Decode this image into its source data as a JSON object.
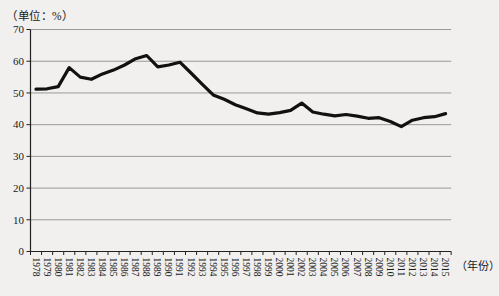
{
  "header": {
    "unit_label": "（单位：%）"
  },
  "axis_captions": {
    "x_caption": "（年份）"
  },
  "chart_data": {
    "type": "line",
    "title": "",
    "xlabel": "年份",
    "ylabel": "%",
    "x": [
      1978,
      1979,
      1980,
      1981,
      1982,
      1983,
      1984,
      1985,
      1986,
      1987,
      1988,
      1989,
      1990,
      1991,
      1992,
      1993,
      1994,
      1995,
      1996,
      1997,
      1998,
      1999,
      2000,
      2001,
      2002,
      2003,
      2004,
      2005,
      2006,
      2007,
      2008,
      2009,
      2010,
      2011,
      2012,
      2013,
      2014,
      2015
    ],
    "values": [
      51.2,
      51.3,
      52,
      58,
      55,
      54.3,
      56,
      57.2,
      58.8,
      60.8,
      61.8,
      58.2,
      58.8,
      59.7,
      56.3,
      52.8,
      49.4,
      48,
      46.3,
      45,
      43.7,
      43.3,
      43.8,
      44.5,
      46.8,
      44,
      43.3,
      42.8,
      43.2,
      42.7,
      42,
      42.2,
      41,
      39.4,
      41.4,
      42.2,
      42.5,
      43.5
    ],
    "ylim": [
      0,
      70
    ],
    "yticks": [
      0,
      10,
      20,
      30,
      40,
      50,
      60,
      70
    ],
    "grid": "horizontal",
    "legend": "none",
    "line_color": "#111111",
    "grid_color": "#908e8b",
    "axis_color": "#222222",
    "background": "#f1f0ee"
  }
}
